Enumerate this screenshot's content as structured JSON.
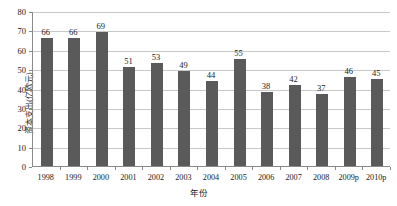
{
  "chart_data": {
    "type": "bar",
    "title": "",
    "subtitle": "",
    "xlabel": "年份",
    "ylabel": "资本支出(亿欧元)",
    "categories": [
      "1998",
      "1999",
      "2000",
      "2001",
      "2002",
      "2003",
      "2004",
      "2005",
      "2006",
      "2007",
      "2008",
      "2009p",
      "2010p"
    ],
    "values": [
      66,
      66,
      69,
      51,
      53,
      49,
      44,
      55,
      38,
      42,
      37,
      46,
      45
    ],
    "ylim": [
      0,
      80
    ],
    "ytick_values": [
      0,
      10,
      20,
      30,
      40,
      50,
      60,
      70,
      80
    ],
    "ytick_labels": [
      "0",
      "10",
      "20",
      "30",
      "40",
      "50",
      "60",
      "70",
      "80"
    ],
    "grid": true,
    "legend": false,
    "legend_position": "none",
    "data_labels": true,
    "bar_color": "#5a5a5a",
    "gridline_color": "#c8c8c8",
    "axis_color": "#8a8a8a",
    "background_color": "#ffffff",
    "text_color": "#1a1a1a"
  }
}
